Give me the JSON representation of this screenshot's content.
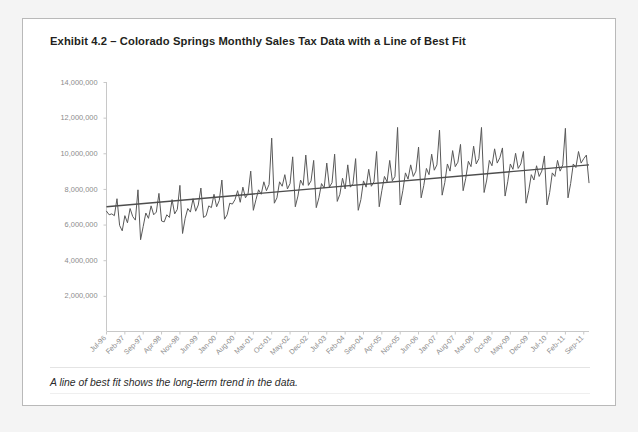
{
  "exhibit": {
    "title": "Exhibit 4.2 – Colorado Springs Monthly Sales Tax Data with  a Line of Best Fit",
    "caption": "A line of best fit shows the long-term trend in the data."
  },
  "colors": {
    "page_background": "#f4f4f4",
    "card_background": "#ffffff",
    "card_border": "#b9b9b9",
    "series_line": "#595959",
    "trend_line": "#4d4d4d",
    "axis": "#c8c8c8",
    "tick_label": "#8c8c8c",
    "title_text": "#231f20"
  },
  "chart_data": {
    "type": "line",
    "title": "Colorado Springs Monthly Sales Tax Data with  a Line of Best Fit",
    "xlabel": "",
    "ylabel": "",
    "ylim": [
      0,
      14000000
    ],
    "grid": false,
    "legend": "none",
    "ytick_labels": [
      "14,000,000",
      "12,000,000",
      "10,000,000",
      "8,000,000",
      "6,000,000",
      "4,000,000",
      "2,000,000"
    ],
    "ytick_values": [
      14000000,
      12000000,
      10000000,
      8000000,
      6000000,
      4000000,
      2000000
    ],
    "xtick_labels": [
      "Jul-96",
      "Feb-97",
      "Sep-97",
      "Apr-98",
      "Nov-98",
      "Jun-99",
      "Jan-00",
      "Aug-00",
      "Mar-01",
      "Oct-01",
      "May-02",
      "Dec-02",
      "Jul-03",
      "Feb-04",
      "Sep-04",
      "Apr-05",
      "Nov-05",
      "Jun-06",
      "Jan-07",
      "Aug-07",
      "Mar-08",
      "Oct-08",
      "May-09",
      "Dec-09",
      "Jul-10",
      "Feb-11",
      "Sep-11"
    ],
    "xtick_interval_months": 7,
    "x_start": "Jul-96",
    "x_end": "Sep-11",
    "series": [
      {
        "name": "Monthly Sales Tax",
        "values": [
          6750000,
          6550000,
          6600000,
          6500000,
          7450000,
          5950000,
          5650000,
          6500000,
          6100000,
          6900000,
          6450000,
          6250000,
          7950000,
          5150000,
          5900000,
          6650000,
          6350000,
          7050000,
          6550000,
          6700000,
          7750000,
          6200000,
          6150000,
          6550000,
          6400000,
          7400000,
          6600000,
          6850000,
          8200000,
          5500000,
          6350000,
          6900000,
          6700000,
          7450000,
          6750000,
          7100000,
          8050000,
          6400000,
          6500000,
          7050000,
          6950000,
          7700000,
          7000000,
          7350000,
          8500000,
          6300000,
          6550000,
          7200000,
          7150000,
          7400000,
          7900000,
          7250000,
          8100000,
          7500000,
          7750000,
          9000000,
          6800000,
          7400000,
          7950000,
          7700000,
          8400000,
          7900000,
          8250000,
          10850000,
          7200000,
          7500000,
          8400000,
          8150000,
          8800000,
          8000000,
          8300000,
          9800000,
          7000000,
          7600000,
          8500000,
          8200000,
          9900000,
          8200000,
          8450000,
          9600000,
          6950000,
          7500000,
          8300000,
          8050000,
          9450000,
          8100000,
          8350000,
          9950000,
          7300000,
          7700000,
          8600000,
          8000000,
          9350000,
          8100000,
          8300000,
          9700000,
          6800000,
          7400000,
          8450000,
          8100000,
          9100000,
          8150000,
          8400000,
          10100000,
          7000000,
          7900000,
          8700000,
          8400000,
          9600000,
          8450000,
          8700000,
          11450000,
          7100000,
          7900000,
          8900000,
          8550000,
          9350000,
          8700000,
          9000000,
          10350000,
          7500000,
          8200000,
          9150000,
          8800000,
          9950000,
          9050000,
          9350000,
          11300000,
          7650000,
          8350000,
          9400000,
          9000000,
          10150000,
          9250000,
          9500000,
          10500000,
          7900000,
          8600000,
          9550000,
          9250000,
          10400000,
          9400000,
          9700000,
          11450000,
          7800000,
          8500000,
          9600000,
          9300000,
          10250000,
          9450000,
          9750000,
          10300000,
          7600000,
          8400000,
          9400000,
          9100000,
          10000000,
          9150000,
          9400000,
          10100000,
          7200000,
          7900000,
          8800000,
          8500000,
          9300000,
          8700000,
          9000000,
          9850000,
          7100000,
          7800000,
          8900000,
          8700000,
          9600000,
          9000000,
          9350000,
          11400000,
          7500000,
          8300000,
          9400000,
          9200000,
          10100000,
          9450000,
          9700000,
          9900000,
          8350000
        ]
      },
      {
        "name": "Line of Best Fit",
        "type": "trend",
        "start_value": 7000000,
        "end_value": 9350000
      }
    ]
  }
}
